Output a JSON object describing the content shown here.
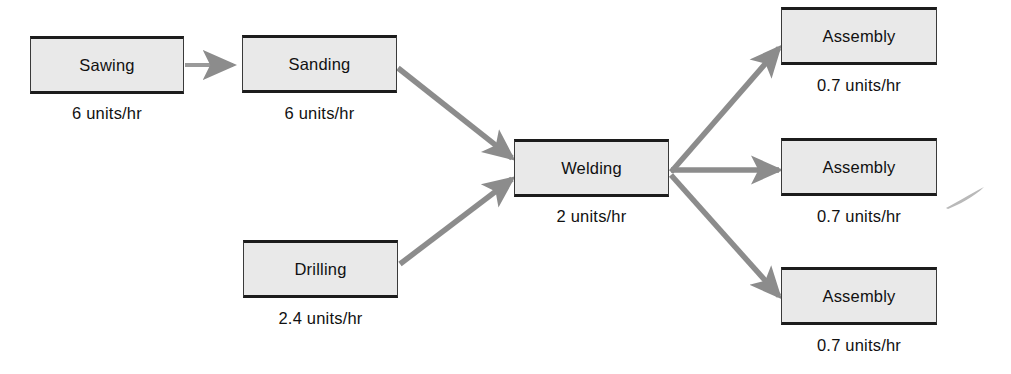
{
  "diagram": {
    "type": "process-flow",
    "colors": {
      "box_fill": "#e9e9e9",
      "box_border": "#1c1c1c",
      "arrow": "#8c8c8c",
      "text": "#111111",
      "background": "#ffffff"
    },
    "units_suffix": "units/hr"
  },
  "nodes": [
    {
      "id": "sawing",
      "label": "Sawing",
      "rate": "6 units/hr",
      "rate_value": 6,
      "x": 30,
      "y": 36,
      "w": 154,
      "h": 58,
      "rate_x": 30,
      "rate_y": 105,
      "rate_w": 154
    },
    {
      "id": "sanding",
      "label": "Sanding",
      "rate": "6 units/hr",
      "rate_value": 6,
      "x": 242,
      "y": 35,
      "w": 155,
      "h": 58,
      "rate_x": 242,
      "rate_y": 105,
      "rate_w": 155
    },
    {
      "id": "drilling",
      "label": "Drilling",
      "rate": "2.4 units/hr",
      "rate_value": 2.4,
      "x": 243,
      "y": 240,
      "w": 155,
      "h": 58,
      "rate_x": 243,
      "rate_y": 310,
      "rate_w": 155
    },
    {
      "id": "welding",
      "label": "Welding",
      "rate": "2 units/hr",
      "rate_value": 2,
      "x": 514,
      "y": 139,
      "w": 155,
      "h": 58,
      "rate_x": 514,
      "rate_y": 208,
      "rate_w": 155
    },
    {
      "id": "assembly-1",
      "label": "Assembly",
      "rate": "0.7 units/hr",
      "rate_value": 0.7,
      "x": 781,
      "y": 7,
      "w": 156,
      "h": 58,
      "rate_x": 781,
      "rate_y": 77,
      "rate_w": 156
    },
    {
      "id": "assembly-2",
      "label": "Assembly",
      "rate": "0.7 units/hr",
      "rate_value": 0.7,
      "x": 781,
      "y": 138,
      "w": 156,
      "h": 58,
      "rate_x": 781,
      "rate_y": 208,
      "rate_w": 156
    },
    {
      "id": "assembly-3",
      "label": "Assembly",
      "rate": "0.7 units/hr",
      "rate_value": 0.7,
      "x": 781,
      "y": 267,
      "w": 156,
      "h": 58,
      "rate_x": 781,
      "rate_y": 337,
      "rate_w": 156
    }
  ],
  "edges": [
    {
      "id": "sawing-to-sanding",
      "from": "sawing",
      "to": "sanding",
      "style": "straight-horizontal"
    },
    {
      "id": "sanding-to-welding",
      "from": "sanding",
      "to": "welding",
      "style": "diagonal-down"
    },
    {
      "id": "drilling-to-welding",
      "from": "drilling",
      "to": "welding",
      "style": "diagonal-up"
    },
    {
      "id": "welding-to-assembly-1",
      "from": "welding",
      "to": "assembly-1",
      "style": "diagonal-up"
    },
    {
      "id": "welding-to-assembly-2",
      "from": "welding",
      "to": "assembly-2",
      "style": "straight-horizontal"
    },
    {
      "id": "welding-to-assembly-3",
      "from": "welding",
      "to": "assembly-3",
      "style": "diagonal-down"
    }
  ]
}
